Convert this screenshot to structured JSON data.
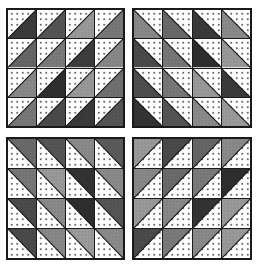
{
  "diagram": {
    "layout": "2x2 blocks, each 4x4 half-square triangle units",
    "background_fabric": {
      "color": "#ffffff",
      "pattern": "small grey dots"
    },
    "border_color": "#1a1a1a",
    "blocks": [
      {
        "id": "top-left",
        "position": "top-left",
        "fabric_half": "lower-right",
        "white_half": "upper-left",
        "diagonal": "bottom-left to top-right",
        "rows": [
          [
            "#3a3a3a",
            "#555555",
            "#999999",
            "#777777"
          ],
          [
            "#666666",
            "#7a7a7a",
            "#3d3d3d",
            "#888888"
          ],
          [
            "#888888",
            "#2e2e2e",
            "#999999",
            "#707070"
          ],
          [
            "#777777",
            "#4a4a4a",
            "#3a3a3a",
            "#555555"
          ]
        ]
      },
      {
        "id": "top-right",
        "position": "top-right",
        "fabric_half": "lower-left",
        "white_half": "upper-right",
        "diagonal": "top-left to bottom-right",
        "rows": [
          [
            "#888888",
            "#6a6a6a",
            "#3a3a3a",
            "#8a8a8a"
          ],
          [
            "#4a4a4a",
            "#777777",
            "#2e2e2e",
            "#999999"
          ],
          [
            "#4e4e4e",
            "#777777",
            "#999999",
            "#3a3a3a"
          ],
          [
            "#333333",
            "#555555",
            "#8a8a8a",
            "#9a9a9a"
          ]
        ]
      },
      {
        "id": "bottom-left",
        "position": "bottom-left",
        "fabric_half": "upper-right",
        "white_half": "lower-left",
        "diagonal": "top-left to bottom-right",
        "rows": [
          [
            "#6a6a6a",
            "#555555",
            "#8a8a8a",
            "#5a5a5a"
          ],
          [
            "#777777",
            "#999999",
            "#333333",
            "#8a8a8a"
          ],
          [
            "#4a4a4a",
            "#8a8a8a",
            "#2e2e2e",
            "#555555"
          ],
          [
            "#4a4a4a",
            "#888888",
            "#9a9a9a",
            "#8a8a8a"
          ]
        ]
      },
      {
        "id": "bottom-right",
        "position": "bottom-right",
        "fabric_half": "upper-left",
        "white_half": "lower-right",
        "diagonal": "bottom-left to top-right",
        "rows": [
          [
            "#999999",
            "#4a4a4a",
            "#666666",
            "#8a8a8a"
          ],
          [
            "#888888",
            "#6a6a6a",
            "#7a7a7a",
            "#2e2e2e"
          ],
          [
            "#999999",
            "#888888",
            "#333333",
            "#999999"
          ],
          [
            "#4a4a4a",
            "#7a7a7a",
            "#8a8a8a",
            "#999999"
          ]
        ]
      }
    ]
  }
}
